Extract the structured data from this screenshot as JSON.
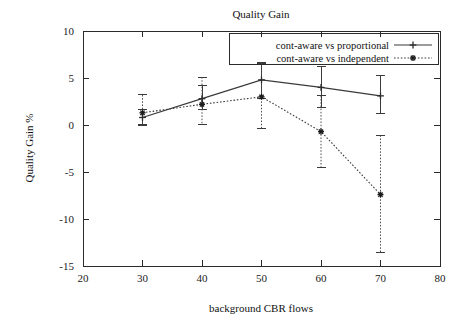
{
  "chart_data": {
    "type": "line",
    "title": "Quality Gain",
    "xlabel": "background CBR flows",
    "ylabel": "Quality Gain %",
    "xlim": [
      20,
      80
    ],
    "ylim": [
      -15,
      10
    ],
    "xticks": [
      20,
      30,
      40,
      50,
      60,
      70,
      80
    ],
    "yticks": [
      10,
      5,
      0,
      -5,
      -10,
      -15
    ],
    "xtick_labels": [
      "20",
      "30",
      "40",
      "50",
      "60",
      "70",
      "80"
    ],
    "ytick_labels": [
      "10",
      "5",
      "0",
      "-5",
      "-10",
      "-15"
    ],
    "grid": false,
    "legend_position": "top-right",
    "x": [
      30,
      40,
      50,
      60,
      70
    ],
    "series": [
      {
        "name": "cont-aware vs proportional",
        "style": "solid",
        "marker": "plus",
        "values": [
          0.8,
          2.8,
          4.8,
          4.0,
          3.1
        ],
        "err_low": [
          0.0,
          1.6,
          2.8,
          1.9,
          1.2
        ],
        "err_high": [
          1.6,
          4.2,
          6.5,
          6.2,
          5.3
        ]
      },
      {
        "name": "cont-aware vs independent",
        "style": "dotted",
        "marker": "star",
        "values": [
          1.3,
          2.2,
          3.0,
          -0.7,
          -7.4
        ],
        "err_low": [
          0.1,
          0.1,
          -0.4,
          -4.5,
          -13.6
        ],
        "err_high": [
          3.2,
          5.1,
          6.6,
          3.1,
          -1.1
        ]
      }
    ]
  }
}
